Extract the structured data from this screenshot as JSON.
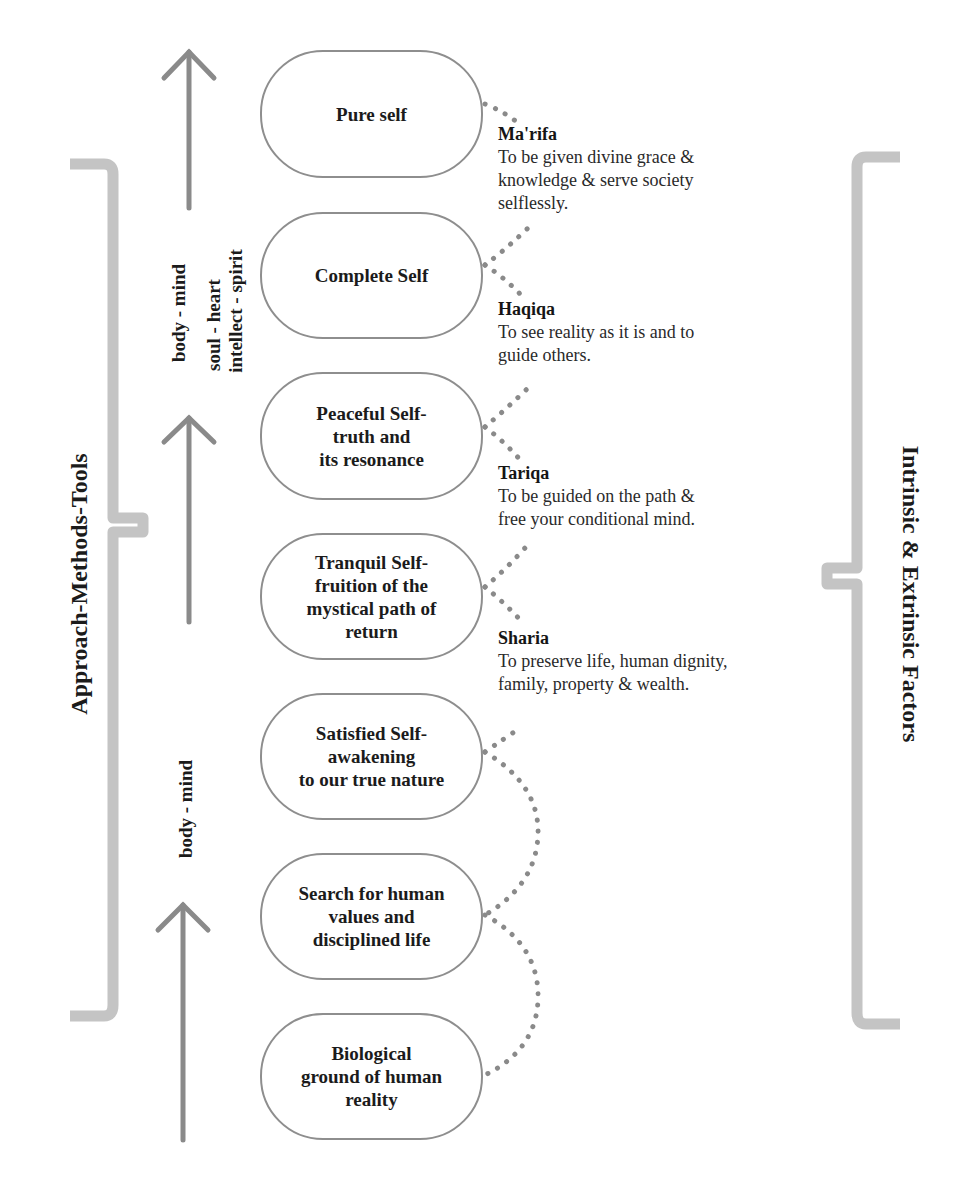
{
  "diagram": {
    "left_bracket_label": "Approach-Methods-Tools",
    "right_bracket_label": "Intrinsic & Extrinsic Factors",
    "axis_labels": {
      "upper": [
        "body - mind",
        "soul - heart",
        "intellect - spirit"
      ],
      "lower": "body - mind"
    },
    "stages": [
      {
        "label": "Pure self"
      },
      {
        "label": "Complete Self"
      },
      {
        "label": "Peaceful Self-\ntruth and\nits resonance"
      },
      {
        "label": "Tranquil Self-\nfruition of the\nmystical path of\nreturn"
      },
      {
        "label": "Satisfied Self-\nawakening\nto our true nature"
      },
      {
        "label": "Search for human\nvalues and\ndisciplined life"
      },
      {
        "label": "Biological\nground of human\nreality"
      }
    ],
    "levels": [
      {
        "title": "Ma'rifa",
        "text": "To be given divine grace &\nknowledge & serve society\nselflessly."
      },
      {
        "title": "Haqiqa",
        "text": "To see reality as it is and to\nguide others."
      },
      {
        "title": "Tariqa",
        "text": "To be guided on the path &\nfree your conditional mind."
      },
      {
        "title": "Sharia",
        "text": "To preserve life, human dignity,\nfamily, property & wealth."
      }
    ],
    "colors": {
      "bracket": "#c4c4c4",
      "arrow": "#8a8a8a",
      "box_border": "#8e8e8e",
      "dots": "#8a8a8a",
      "text": "#1b1b1b"
    }
  }
}
